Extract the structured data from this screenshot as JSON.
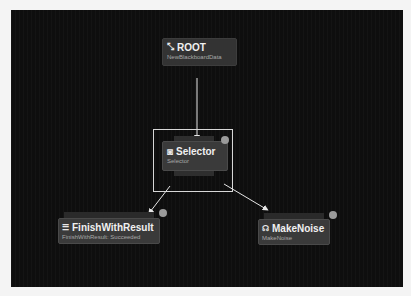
{
  "graph": {
    "nodes": {
      "root": {
        "title": "ROOT",
        "subtitle": "NewBlackboardData",
        "icon": "root-icon"
      },
      "selector": {
        "title": "Selector",
        "subtitle": "Selector",
        "icon": "selector-icon",
        "selected": true
      },
      "finish": {
        "title": "FinishWithResult",
        "subtitle": "FinishWithResult: Succeeded",
        "icon": "finish-task-icon"
      },
      "noise": {
        "title": "MakeNoise",
        "subtitle": "MakeNoise",
        "icon": "make-noise-icon"
      }
    },
    "edges": [
      {
        "from": "root",
        "to": "selector"
      },
      {
        "from": "selector",
        "to": "finish"
      },
      {
        "from": "selector",
        "to": "noise"
      }
    ],
    "colors": {
      "background": "#0e0e0e",
      "node": "#3a3a3a",
      "edge": "#e6e6e6",
      "selection": "#d8d8d8"
    }
  },
  "icons": {
    "root": "⤡",
    "selector": "◙",
    "finish": "☰",
    "noise": "☊"
  }
}
